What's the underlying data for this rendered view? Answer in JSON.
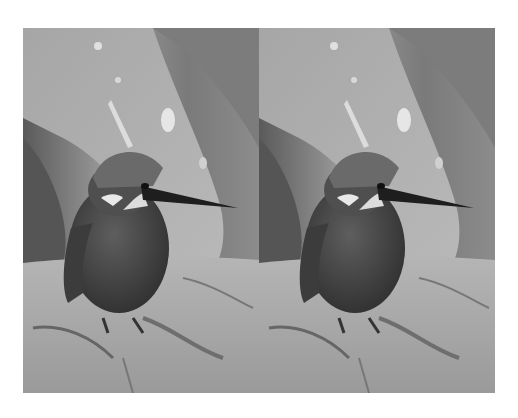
{
  "figure": {
    "layout": "side-by-side",
    "panels": [
      {
        "id": "left",
        "subject": "kingfisher perched on rock",
        "tone": "grayscale"
      },
      {
        "id": "right",
        "subject": "kingfisher perched on rock",
        "tone": "grayscale"
      }
    ],
    "colors": {
      "background": "#ffffff",
      "leaf_light": "#b8b8b8",
      "leaf_dark": "#6a6a6a",
      "rock": "#a8a8a8",
      "bird_body": "#4a4a4a",
      "beak": "#1e1e1e"
    }
  }
}
